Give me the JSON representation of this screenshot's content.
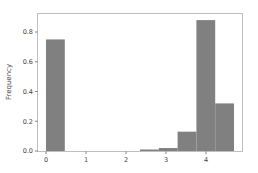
{
  "chart_data": {
    "type": "bar",
    "title": "",
    "xlabel": "",
    "ylabel": "Frequency",
    "bars": [
      {
        "x0": 0.0,
        "x1": 0.47,
        "value": 0.75
      },
      {
        "x0": 2.35,
        "x1": 2.82,
        "value": 0.01
      },
      {
        "x0": 2.82,
        "x1": 3.29,
        "value": 0.02
      },
      {
        "x0": 3.29,
        "x1": 3.76,
        "value": 0.13
      },
      {
        "x0": 3.76,
        "x1": 4.23,
        "value": 0.88
      },
      {
        "x0": 4.23,
        "x1": 4.7,
        "value": 0.32
      }
    ],
    "x_ticks": [
      0,
      1,
      2,
      3,
      4
    ],
    "y_ticks": [
      0.0,
      0.2,
      0.4,
      0.6,
      0.8
    ],
    "y_tick_labels": [
      "0.0",
      "0.2",
      "0.4",
      "0.6",
      "0.8"
    ],
    "xlim": [
      -0.23,
      4.93
    ],
    "ylim": [
      0,
      0.93
    ],
    "grid": false,
    "legend": null,
    "bar_color": "#808080"
  }
}
